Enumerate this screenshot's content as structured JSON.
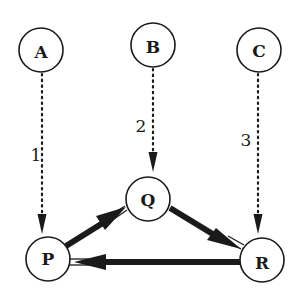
{
  "diagram": {
    "type": "directed-graph",
    "colors": {
      "stroke": "#1a1a1a",
      "background": "#ffffff"
    },
    "nodes": [
      {
        "id": "A",
        "label": "A",
        "cx": 41,
        "cy": 50
      },
      {
        "id": "B",
        "label": "B",
        "cx": 153,
        "cy": 45
      },
      {
        "id": "C",
        "label": "C",
        "cx": 259,
        "cy": 50
      },
      {
        "id": "Q",
        "label": "Q",
        "cx": 148,
        "cy": 200
      },
      {
        "id": "P",
        "label": "P",
        "cx": 48,
        "cy": 259
      },
      {
        "id": "R",
        "label": "R",
        "cx": 262,
        "cy": 259
      }
    ],
    "edges": [
      {
        "from": "A",
        "to": "P",
        "style": "dotted",
        "label": "1"
      },
      {
        "from": "B",
        "to": "Q",
        "style": "dotted",
        "label": "2"
      },
      {
        "from": "C",
        "to": "R",
        "style": "dotted",
        "label": "3"
      },
      {
        "from": "P",
        "to": "Q",
        "style": "thick"
      },
      {
        "from": "Q",
        "to": "R",
        "style": "thick"
      },
      {
        "from": "R",
        "to": "P",
        "style": "thick"
      }
    ]
  }
}
